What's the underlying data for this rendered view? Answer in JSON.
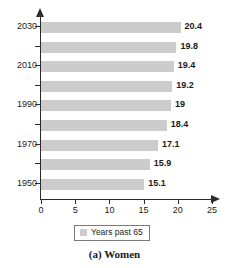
{
  "chart_data": {
    "type": "bar",
    "orientation": "horizontal",
    "title": "",
    "caption": "(a) Women",
    "xlabel": "",
    "ylabel": "",
    "xlim": [
      0,
      25
    ],
    "xticks": [
      0,
      5,
      10,
      15,
      20,
      25
    ],
    "grid": false,
    "legend_position": "bottom",
    "legend": [
      "Years past 65"
    ],
    "series_name": "Years past 65",
    "bar_color": "#cccccc",
    "axis_color": "#2b2b2b",
    "categories": [
      "1950",
      "1960",
      "1970",
      "1980",
      "1990",
      "2000",
      "2010",
      "2020",
      "2030"
    ],
    "visible_category_labels": [
      "1950",
      "1970",
      "1990",
      "2010",
      "2030"
    ],
    "values": [
      15.1,
      15.9,
      17.1,
      18.4,
      19,
      19.2,
      19.4,
      19.8,
      20.4
    ],
    "bars": [
      {
        "category": "2030",
        "value": 20.4,
        "label": "20.4",
        "axis_label": "2030"
      },
      {
        "category": "2020",
        "value": 19.8,
        "label": "19.8",
        "axis_label": ""
      },
      {
        "category": "2010",
        "value": 19.4,
        "label": "19.4",
        "axis_label": "2010"
      },
      {
        "category": "2000",
        "value": 19.2,
        "label": "19.2",
        "axis_label": ""
      },
      {
        "category": "1990",
        "value": 19,
        "label": "19",
        "axis_label": "1990"
      },
      {
        "category": "1980",
        "value": 18.4,
        "label": "18.4",
        "axis_label": ""
      },
      {
        "category": "1970",
        "value": 17.1,
        "label": "17.1",
        "axis_label": "1970"
      },
      {
        "category": "1960",
        "value": 15.9,
        "label": "15.9",
        "axis_label": ""
      },
      {
        "category": "1950",
        "value": 15.1,
        "label": "15.1",
        "axis_label": "1950"
      }
    ]
  },
  "axis": {
    "x_tick_labels": [
      "0",
      "5",
      "10",
      "15",
      "20",
      "25"
    ],
    "y_tick_labels": [
      "2030",
      "2010",
      "1990",
      "1970",
      "1950"
    ]
  },
  "legend": {
    "label": "Years past 65"
  },
  "caption": {
    "text": "(a) Women"
  }
}
